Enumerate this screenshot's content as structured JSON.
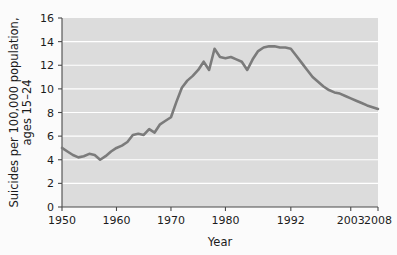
{
  "chart_data": {
    "type": "line",
    "title": "",
    "xlabel": "Year",
    "ylabel": "Suicides per 100,000 population, ages 15–24",
    "ylabel_line1": "Suicides per 100,000 population,",
    "ylabel_line2": "ages 15–24",
    "ylim": [
      0,
      16
    ],
    "xlim": [
      1950,
      2008
    ],
    "grid": "horizontal",
    "legend": "none",
    "plot_bg_color": "#dcdcdc",
    "gridline_color": "#ffffff",
    "line_color": "#7b7b7b",
    "axis_color": "#4a4a4a",
    "page_bg_color": "#fbfbfb",
    "yticks": [
      0,
      2,
      4,
      6,
      8,
      10,
      12,
      14,
      16
    ],
    "ytick_labels": [
      "0",
      "2",
      "4",
      "6",
      "8",
      "10",
      "12",
      "14",
      "16"
    ],
    "xticks": [
      1950,
      1960,
      1970,
      1980,
      1992,
      2003,
      2008
    ],
    "xtick_labels": [
      "1950",
      "1960",
      "1970",
      "1980",
      "1992",
      "2003",
      "2008"
    ],
    "x": [
      1950,
      1951,
      1952,
      1953,
      1954,
      1955,
      1956,
      1957,
      1958,
      1959,
      1960,
      1961,
      1962,
      1963,
      1964,
      1965,
      1966,
      1967,
      1968,
      1969,
      1970,
      1971,
      1972,
      1973,
      1974,
      1975,
      1976,
      1977,
      1978,
      1979,
      1980,
      1981,
      1982,
      1983,
      1984,
      1985,
      1986,
      1987,
      1988,
      1989,
      1990,
      1991,
      1992,
      1993,
      1994,
      1995,
      1996,
      1997,
      1998,
      1999,
      2000,
      2001,
      2002,
      2003,
      2004,
      2005,
      2006,
      2007,
      2008
    ],
    "values": [
      5.0,
      4.7,
      4.4,
      4.2,
      4.3,
      4.5,
      4.4,
      4.0,
      4.3,
      4.7,
      5.0,
      5.2,
      5.5,
      6.1,
      6.2,
      6.1,
      6.6,
      6.3,
      7.0,
      7.3,
      7.6,
      8.9,
      10.1,
      10.7,
      11.1,
      11.6,
      12.3,
      11.6,
      13.4,
      12.7,
      12.6,
      12.7,
      12.5,
      12.3,
      11.6,
      12.5,
      13.2,
      13.5,
      13.6,
      13.6,
      13.5,
      13.5,
      13.4,
      12.8,
      12.2,
      11.6,
      11.0,
      10.6,
      10.2,
      9.9,
      9.7,
      9.6,
      9.4,
      9.2,
      9.0,
      8.8,
      8.6,
      8.45,
      8.3
    ],
    "notes": {
      "line_style": "solid",
      "markers": "none"
    }
  },
  "geometry": {
    "plot_left": 62,
    "plot_right": 378,
    "plot_top": 18,
    "plot_bottom": 207
  }
}
